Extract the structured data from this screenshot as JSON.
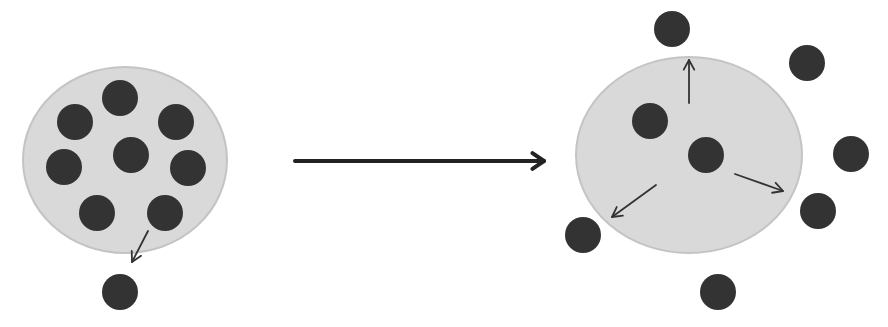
{
  "canvas": {
    "width": 888,
    "height": 327,
    "background": "#ffffff"
  },
  "colors": {
    "membrane_fill": "#d9d9d9",
    "membrane_stroke": "#c4c4c4",
    "particle": "#333333",
    "arrow": "#333333",
    "main_arrow": "#222222"
  },
  "panels": [
    {
      "id": "before",
      "membrane": {
        "cx": 125,
        "cy": 160,
        "rx": 102,
        "ry": 93
      },
      "particles": [
        {
          "cx": 120,
          "cy": 98,
          "r": 18
        },
        {
          "cx": 75,
          "cy": 122,
          "r": 18
        },
        {
          "cx": 176,
          "cy": 122,
          "r": 18
        },
        {
          "cx": 64,
          "cy": 167,
          "r": 18
        },
        {
          "cx": 131,
          "cy": 155,
          "r": 18
        },
        {
          "cx": 188,
          "cy": 168,
          "r": 18
        },
        {
          "cx": 97,
          "cy": 213,
          "r": 18
        },
        {
          "cx": 165,
          "cy": 213,
          "r": 18
        },
        {
          "cx": 120,
          "cy": 292,
          "r": 18
        }
      ],
      "arrows": [
        {
          "x1": 148,
          "y1": 231,
          "x2": 132,
          "y2": 262
        }
      ]
    },
    {
      "id": "after",
      "membrane": {
        "cx": 689,
        "cy": 155,
        "rx": 113,
        "ry": 98
      },
      "particles": [
        {
          "cx": 672,
          "cy": 29,
          "r": 18
        },
        {
          "cx": 807,
          "cy": 63,
          "r": 18
        },
        {
          "cx": 650,
          "cy": 121,
          "r": 18
        },
        {
          "cx": 706,
          "cy": 155,
          "r": 18
        },
        {
          "cx": 851,
          "cy": 154,
          "r": 18
        },
        {
          "cx": 818,
          "cy": 211,
          "r": 18
        },
        {
          "cx": 583,
          "cy": 235,
          "r": 18
        },
        {
          "cx": 718,
          "cy": 292,
          "r": 18
        }
      ],
      "arrows": [
        {
          "x1": 689,
          "y1": 103,
          "x2": 689,
          "y2": 60
        },
        {
          "x1": 656,
          "y1": 185,
          "x2": 612,
          "y2": 217
        },
        {
          "x1": 735,
          "y1": 174,
          "x2": 783,
          "y2": 191
        }
      ]
    }
  ],
  "transition_arrow": {
    "x1": 295,
    "y1": 161,
    "x2": 544,
    "y2": 161
  }
}
